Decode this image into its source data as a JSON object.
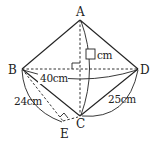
{
  "diagram": {
    "type": "geometry-figure",
    "points": {
      "A": {
        "label": "A",
        "x": 80,
        "y": 20
      },
      "B": {
        "label": "B",
        "x": 22,
        "y": 69
      },
      "C": {
        "label": "C",
        "x": 80,
        "y": 116
      },
      "D": {
        "label": "D",
        "x": 138,
        "y": 69
      },
      "E": {
        "label": "E",
        "x": 63,
        "y": 121
      }
    },
    "solid_segments": [
      "AB",
      "AD",
      "BC",
      "CD"
    ],
    "dashed_segments": [
      "AC",
      "BD",
      "BE",
      "EC"
    ],
    "right_angles": [
      "AC ⟂ BD at center",
      "BE ⟂ EC at E"
    ],
    "dimensions": {
      "BD": "40cm",
      "AC_unknown": "cm",
      "BE": "24cm",
      "CD": "25cm"
    },
    "answer_box": "□"
  }
}
